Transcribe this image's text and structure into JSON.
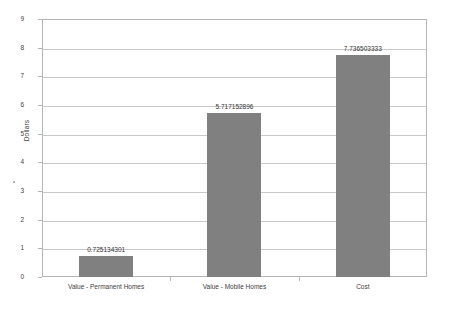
{
  "chart_data": {
    "type": "bar",
    "title": "",
    "xlabel": "",
    "ylabel": "Dollars",
    "categories": [
      "Value - Permanent Homes",
      "Value - Mobile Homes",
      "Cost"
    ],
    "values": [
      0.725134301,
      5.717152896,
      7.736503333
    ],
    "value_labels": [
      "0.725134301",
      "5.717152896",
      "7.736503333"
    ],
    "ylim": [
      0,
      9
    ],
    "ytick_labels": [
      "0",
      "1",
      "2",
      "3",
      "4",
      "5",
      "6",
      "7",
      "8",
      "9"
    ],
    "grid": true,
    "legend": "none",
    "series": [
      {
        "name": "",
        "values": [
          0.725134301,
          5.717152896,
          7.736503333
        ]
      }
    ],
    "colors": {
      "bar_fill": "#808080",
      "gridline": "#c9c9c9",
      "frame": "#b4b4b4",
      "text": "#404040",
      "background": "#ffffff"
    }
  }
}
